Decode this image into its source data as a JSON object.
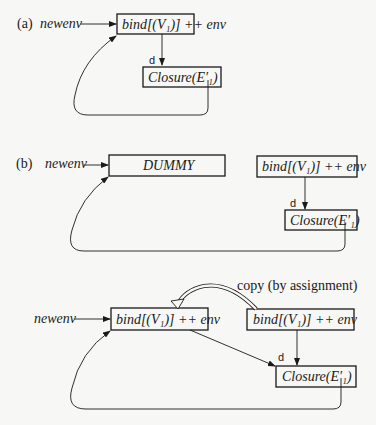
{
  "diagram": {
    "panel_a": {
      "label": "(a)",
      "source": "newenv",
      "bind_box": "bind[(V₁)] ++ env",
      "closure_box": "Closure(E′₁)",
      "edge_label": "d"
    },
    "panel_b": {
      "label": "(b)",
      "source": "newenv",
      "dummy_box": "DUMMY",
      "bind_box": "bind[(V₁)] ++ env",
      "closure_box": "Closure(E′₁)",
      "edge_label": "d"
    },
    "panel_c": {
      "source": "newenv",
      "target_box": "bind[(V₁)] ++ env",
      "bind_box": "bind[(V₁)] ++ env",
      "closure_box": "Closure(E′₁)",
      "edge_label": "d",
      "copy_label": "copy (by assignment)"
    }
  }
}
